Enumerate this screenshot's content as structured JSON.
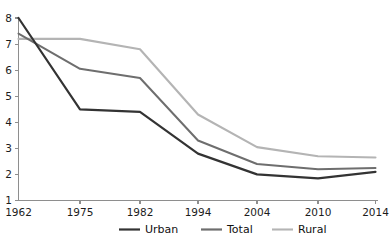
{
  "chart_data": {
    "type": "line",
    "title": "",
    "subtitle": "",
    "xlabel": "",
    "ylabel": "",
    "x": [
      "1962",
      "1975",
      "1982",
      "1994",
      "2004",
      "2010",
      "2014"
    ],
    "categories": [
      "1962",
      "1975",
      "1982",
      "1994",
      "2004",
      "2010",
      "2014"
    ],
    "series": [
      {
        "name": "Urban",
        "color": "#333333",
        "values": [
          8.0,
          4.5,
          4.4,
          2.8,
          2.0,
          1.85,
          2.1
        ]
      },
      {
        "name": "Total",
        "color": "#6e6e6e",
        "values": [
          7.4,
          6.05,
          5.7,
          3.3,
          2.4,
          2.2,
          2.25
        ]
      },
      {
        "name": "Rural",
        "color": "#b4b4b4",
        "values": [
          7.2,
          7.2,
          6.8,
          4.3,
          3.05,
          2.7,
          2.65
        ]
      }
    ],
    "xlim": [
      0,
      6
    ],
    "ylim": [
      1,
      8
    ],
    "ytick_values": [
      1,
      2,
      3,
      4,
      5,
      6,
      7,
      8
    ],
    "ytick_labels": [
      "1",
      "2",
      "3",
      "4",
      "5",
      "6",
      "7",
      "8"
    ],
    "xtick_labels": [
      "1962",
      "1975",
      "1982",
      "1994",
      "2004",
      "2010",
      "2014"
    ],
    "grid": false,
    "legend_position": "bottom",
    "legend_entries": [
      "Urban",
      "Total",
      "Rural"
    ],
    "annotations": []
  },
  "axes": {
    "y_axis_name": "y-axis",
    "x_axis_name": "x-axis"
  },
  "legend": {
    "items": [
      {
        "label": "Urban",
        "color": "#333333"
      },
      {
        "label": "Total",
        "color": "#6e6e6e"
      },
      {
        "label": "Rural",
        "color": "#b4b4b4"
      }
    ]
  },
  "colors": {
    "background": "#ffffff",
    "axis": "#8e8e8e",
    "text": "#1c1c1c",
    "urban": "#333333",
    "total": "#6e6e6e",
    "rural": "#b4b4b4"
  }
}
